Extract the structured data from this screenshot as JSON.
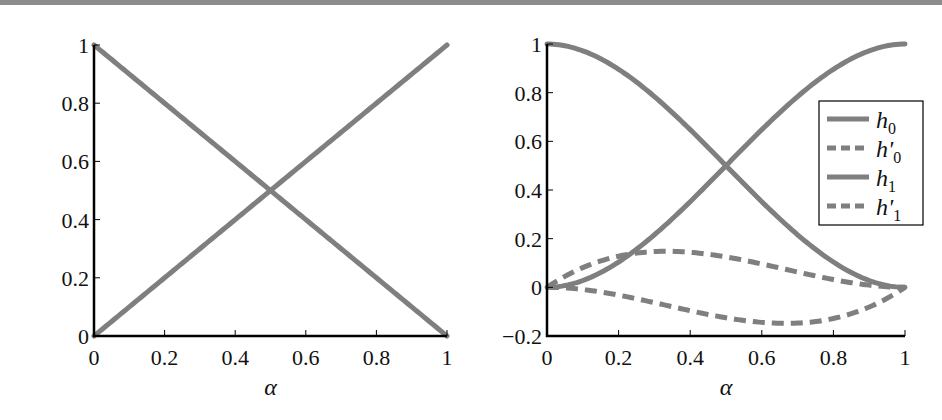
{
  "chart_data": [
    {
      "type": "line",
      "title": "",
      "xlabel": "α",
      "ylabel": "",
      "xlim": [
        0,
        1
      ],
      "ylim": [
        0,
        1
      ],
      "grid": false,
      "xticks": [
        "0",
        "0.2",
        "0.4",
        "0.6",
        "0.8",
        "1"
      ],
      "yticks": [
        "0",
        "0.2",
        "0.4",
        "0.6",
        "0.8",
        "1"
      ],
      "x": [
        0,
        0.2,
        0.4,
        0.5,
        0.6,
        0.8,
        1
      ],
      "series": [
        {
          "name": "1 − α",
          "style": "solid",
          "values": [
            1,
            0.8,
            0.6,
            0.5,
            0.4,
            0.2,
            0
          ]
        },
        {
          "name": "α",
          "style": "solid",
          "values": [
            0,
            0.2,
            0.4,
            0.5,
            0.6,
            0.8,
            1
          ]
        }
      ],
      "legend": null
    },
    {
      "type": "line",
      "title": "",
      "xlabel": "α",
      "ylabel": "",
      "xlim": [
        0,
        1
      ],
      "ylim": [
        -0.2,
        1
      ],
      "grid": false,
      "xticks": [
        "0",
        "0.2",
        "0.4",
        "0.6",
        "0.8",
        "1"
      ],
      "yticks": [
        "−0.2",
        "0",
        "0.2",
        "0.4",
        "0.6",
        "0.8",
        "1"
      ],
      "x": [
        0,
        0.2,
        0.4,
        0.5,
        0.6,
        0.8,
        1
      ],
      "series": [
        {
          "name": "h0",
          "style": "solid",
          "values": [
            1,
            0.896,
            0.648,
            0.5,
            0.352,
            0.104,
            0
          ]
        },
        {
          "name": "h'0",
          "style": "dashed",
          "values": [
            0,
            0.128,
            0.144,
            0.125,
            0.096,
            0.032,
            0
          ]
        },
        {
          "name": "h1",
          "style": "solid",
          "values": [
            0,
            0.104,
            0.352,
            0.5,
            0.648,
            0.896,
            1
          ]
        },
        {
          "name": "h'1",
          "style": "dashed",
          "values": [
            0,
            -0.032,
            -0.096,
            -0.125,
            -0.144,
            -0.128,
            0
          ]
        }
      ],
      "legend": {
        "position": "upper right (inside, below top)",
        "entries": [
          {
            "base": "h",
            "sub": "0",
            "prime": false,
            "style": "solid"
          },
          {
            "base": "h",
            "sub": "0",
            "prime": true,
            "style": "dashed"
          },
          {
            "base": "h",
            "sub": "1",
            "prime": false,
            "style": "solid"
          },
          {
            "base": "h",
            "sub": "1",
            "prime": true,
            "style": "dashed"
          }
        ]
      }
    }
  ],
  "colors": {
    "curve": "#7f7f7f",
    "axis": "#000000",
    "top_bar": "#8c8c8c"
  },
  "labels": {
    "left_xlabel": "α",
    "right_xlabel": "α",
    "legend": [
      "h0",
      "h'0",
      "h1",
      "h'1"
    ]
  }
}
